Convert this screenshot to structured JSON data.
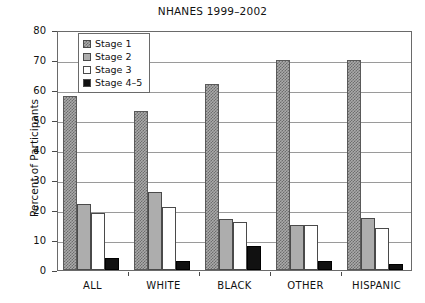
{
  "chart_data": {
    "type": "bar",
    "title": "NHANES 1999–2002",
    "xlabel": "",
    "ylabel": "Percent of Participants",
    "ylim": [
      0,
      80
    ],
    "ytick_step": 10,
    "yticks": [
      "0",
      "10",
      "20",
      "30",
      "40",
      "50",
      "60",
      "70",
      "80"
    ],
    "grid": true,
    "legend_position": "upper-left-inside",
    "categories": [
      "ALL",
      "WHITE",
      "BLACK",
      "OTHER",
      "HISPANIC"
    ],
    "series": [
      {
        "name": "Stage 1",
        "values": [
          58,
          53,
          62,
          70,
          70
        ]
      },
      {
        "name": "Stage 2",
        "values": [
          22,
          26,
          17,
          15,
          17.5
        ]
      },
      {
        "name": "Stage 3",
        "values": [
          19,
          21,
          16,
          15,
          14
        ]
      },
      {
        "name": "Stage 4–5",
        "values": [
          4,
          3,
          8,
          3,
          2
        ]
      }
    ]
  },
  "legend": {
    "items": [
      {
        "label": "Stage 1",
        "swatch": "hatched-gray"
      },
      {
        "label": "Stage 2",
        "swatch": "solid-gray"
      },
      {
        "label": "Stage 3",
        "swatch": "white"
      },
      {
        "label": "Stage 4–5",
        "swatch": "black"
      }
    ]
  },
  "colors": {
    "stage1": "#aaaaaa",
    "stage2": "#adadad",
    "stage3": "#ffffff",
    "stage4_5": "#111111",
    "axis": "#4a4a4a",
    "grid": "#9a9a9a",
    "text": "#111111"
  }
}
